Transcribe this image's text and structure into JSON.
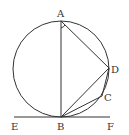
{
  "diagram": {
    "type": "geometry",
    "points": {
      "A": {
        "label": "A",
        "x": 61,
        "y": 21
      },
      "B": {
        "label": "B",
        "x": 61,
        "y": 117
      },
      "C": {
        "label": "C",
        "x": 102,
        "y": 96
      },
      "D": {
        "label": "D",
        "x": 109,
        "y": 68
      },
      "E": {
        "label": "E",
        "x": 14,
        "y": 117
      },
      "F": {
        "label": "F",
        "x": 110,
        "y": 117
      }
    },
    "circle": {
      "cx": 61,
      "cy": 69,
      "r": 48
    },
    "segments": [
      "AB",
      "AD",
      "BD",
      "BC",
      "CD",
      "EF"
    ],
    "stroke_color": "#333333"
  }
}
